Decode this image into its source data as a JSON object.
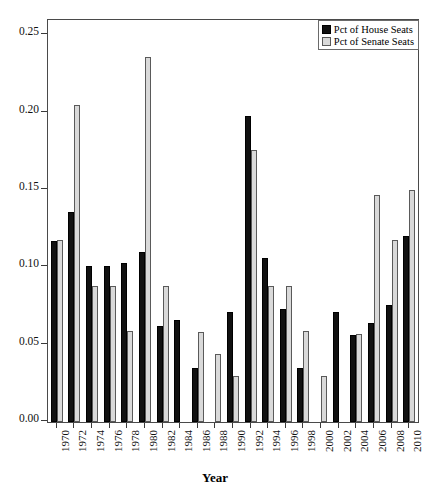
{
  "chart_data": {
    "type": "bar",
    "title": "",
    "xlabel": "Year",
    "ylabel": "",
    "ylim": [
      0.0,
      0.26
    ],
    "yticks": [
      "0.00",
      "0.05",
      "0.10",
      "0.15",
      "0.20",
      "0.25"
    ],
    "ytick_values": [
      0.0,
      0.05,
      0.1,
      0.15,
      0.2,
      0.25
    ],
    "grid": false,
    "legend_position": "top-right",
    "categories": [
      "1970",
      "1972",
      "1974",
      "1976",
      "1978",
      "1980",
      "1982",
      "1984",
      "1986",
      "1988",
      "1990",
      "1992",
      "1994",
      "1996",
      "1998",
      "2000",
      "2002",
      "2004",
      "2006",
      "2008",
      "2010"
    ],
    "series": [
      {
        "name": "Pct of House Seats",
        "color": "#111111",
        "values": [
          0.117,
          0.136,
          0.101,
          0.101,
          0.103,
          0.11,
          0.062,
          0.066,
          0.035,
          0.0,
          0.071,
          0.198,
          0.106,
          0.073,
          0.035,
          0.0,
          0.071,
          0.056,
          0.064,
          0.076,
          0.12
        ]
      },
      {
        "name": "Pct of Senate Seats",
        "color": "#d9d9d9",
        "values": [
          0.118,
          0.205,
          0.088,
          0.088,
          0.059,
          0.236,
          0.088,
          0.0,
          0.058,
          0.044,
          0.03,
          0.176,
          0.088,
          0.088,
          0.059,
          0.03,
          0.0,
          0.057,
          0.147,
          0.118,
          0.15
        ]
      }
    ]
  },
  "legend": {
    "items": [
      {
        "label": "Pct of House Seats",
        "swatch": "house"
      },
      {
        "label": "Pct of Senate Seats",
        "swatch": "senate"
      }
    ]
  },
  "axes": {
    "x_title": "Year"
  }
}
